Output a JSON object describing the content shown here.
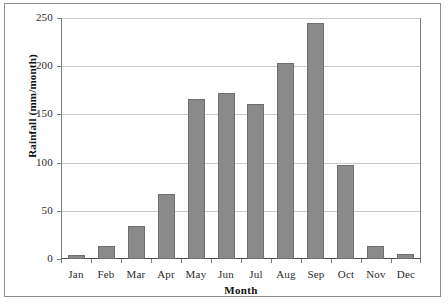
{
  "chart_data": {
    "type": "bar",
    "title": "",
    "xlabel": "Month",
    "ylabel": "Rainfall (mm/month)",
    "categories": [
      "Jan",
      "Feb",
      "Mar",
      "Apr",
      "May",
      "Jun",
      "Jul",
      "Aug",
      "Sep",
      "Oct",
      "Nov",
      "Dec"
    ],
    "values": [
      4,
      14,
      34,
      67,
      166,
      172,
      161,
      203,
      245,
      98,
      13,
      5
    ],
    "ylim": [
      0,
      250
    ],
    "yticks": [
      0,
      50,
      100,
      150,
      200,
      250
    ],
    "ytick_labels": [
      "0",
      "50",
      "100",
      "150",
      "200",
      "250"
    ],
    "grid": "horizontal",
    "legend": "none",
    "bar_color": "#8a8a8a",
    "bar_edge_color": "#6f6f6f",
    "gridline_color": "#c9c9c9",
    "axis_color": "#7d7d7d",
    "frame_color": "#8f8f8f",
    "background": "#ffffff"
  }
}
